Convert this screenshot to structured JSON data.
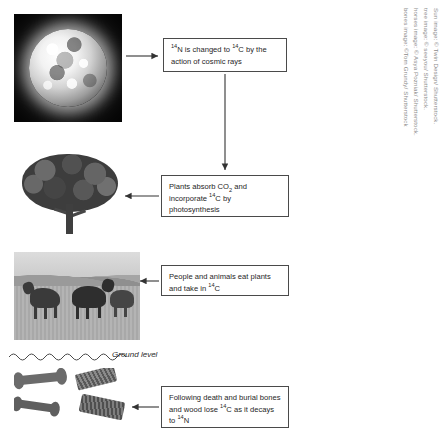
{
  "diagram": {
    "ground_label": "Ground level",
    "boxes": [
      {
        "id": "nitrogen",
        "name": "box-nitrogen-to-carbon",
        "line1_pre": "",
        "sup1": "14",
        "text_a": "N is changed to ",
        "sup2": "14",
        "text_b": "C by",
        "line2": "the action of cosmic rays",
        "plain": "14N is changed to 14C by the action of cosmic rays"
      },
      {
        "id": "plants",
        "name": "box-plants-photosynthesis",
        "line1_a": "Plants absorb CO",
        "sub1": "2",
        "line2_a": "and incorporate ",
        "sup1": "14",
        "line2_b": "C by",
        "line3": "photosynthesis",
        "plain": "Plants absorb CO2 and incorporate 14C by photosynthesis"
      },
      {
        "id": "people",
        "name": "box-people-animals-eat",
        "line1": "People and animals eat",
        "line2_a": "plants and take in ",
        "sup1": "14",
        "line2_b": "C",
        "plain": "People and animals eat plants and take in 14C"
      },
      {
        "id": "death",
        "name": "box-death-and-burial",
        "line1": "Following death and burial",
        "line2_a": "bones and wood lose ",
        "sup1": "14",
        "line2_b": "C",
        "line3_a": "as it decays to ",
        "sup2": "14",
        "line3_b": "N",
        "plain": "Following death and burial bones and wood lose 14C as it decays to 14N"
      }
    ],
    "images": [
      {
        "id": "sun",
        "name": "sun-photo",
        "alt": "Sun"
      },
      {
        "id": "tree",
        "name": "tree-photo",
        "alt": "Tree"
      },
      {
        "id": "horses",
        "name": "horses-photo",
        "alt": "Horses in field"
      },
      {
        "id": "bones",
        "name": "bones-photo",
        "alt": "Buried bones and wood"
      }
    ]
  },
  "credits": [
    "Sun image: © Twin Design/ Shutterstock.",
    "tree image: © seeyou/ Shutterstock.",
    "horses image: © Asya Pozniak/ Shutterstock.",
    "bones image: ©Tom Grundy/ Shutterstock"
  ],
  "colors": {
    "box_border": "#4a4a4a",
    "text": "#262626",
    "credit_text": "#8a8a8a",
    "arrow": "#333333",
    "background": "#ffffff"
  }
}
